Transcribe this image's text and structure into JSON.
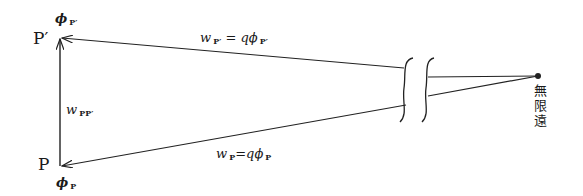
{
  "diagram": {
    "points": {
      "P_prime": {
        "label": "P′",
        "potential_label": "ϕ",
        "potential_sub": "P′"
      },
      "P": {
        "label": "P",
        "potential_label": "ϕ",
        "potential_sub": "P"
      },
      "infinity": {
        "label": "無限遠"
      }
    },
    "edges": {
      "upper": {
        "lhs": "w",
        "lhs_sub": "P′",
        "eq": " = ",
        "rhs": "qϕ",
        "rhs_sub": "P′"
      },
      "lower": {
        "lhs": "w",
        "lhs_sub": "P",
        "eq": "=",
        "rhs": "qϕ",
        "rhs_sub": "P"
      },
      "vertical": {
        "lhs": "w",
        "lhs_sub": "PP′"
      }
    },
    "colors": {
      "line": "#222222",
      "background": "#ffffff"
    }
  }
}
